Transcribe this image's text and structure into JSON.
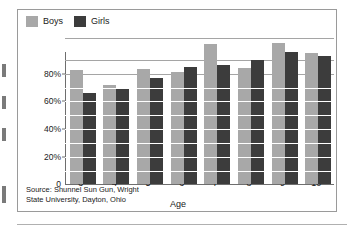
{
  "chart_data": {
    "type": "bar",
    "title": "",
    "xlabel": "Age",
    "ylabel": "",
    "categories": [
      "3",
      "4",
      "5",
      "6",
      "7",
      "8",
      "9",
      "10"
    ],
    "series": [
      {
        "name": "Boys",
        "color": "#a8a8a8",
        "values": [
          70,
          61,
          71,
          69,
          86,
          71.5,
          86.5,
          80.5
        ]
      },
      {
        "name": "Girls",
        "color": "#3c3c3c",
        "values": [
          56,
          59,
          65,
          72,
          73,
          76.5,
          81,
          79
        ]
      }
    ],
    "ylim": [
      0,
      96
    ],
    "yticks": [
      0,
      20,
      40,
      60,
      80
    ],
    "ytick_labels": [
      "0",
      "20%",
      "40%",
      "60%",
      "80%"
    ],
    "gridlines": [
      10,
      20,
      30,
      40,
      50,
      60,
      70,
      80,
      90
    ],
    "grid": true,
    "legend_position": "top-left",
    "source_note": [
      "Source: Shunnel Sun Gun, Wright",
      "State University, Dayton, Ohio"
    ]
  },
  "legend": {
    "entries": [
      {
        "label": "Boys",
        "swatch": "legend-swatch-boys"
      },
      {
        "label": "Girls",
        "swatch": "legend-swatch-girls"
      }
    ]
  },
  "axis": {
    "x_title": "Age",
    "y_labels": [
      "80%",
      "60%",
      "40%",
      "20%",
      "0"
    ],
    "x_labels": [
      "3",
      "4",
      "5",
      "6",
      "7",
      "8",
      "9",
      "10"
    ]
  },
  "source": {
    "line1": "Source: Shunnel Sun Gun, Wright",
    "line2": "State University, Dayton, Ohio"
  },
  "colors": {
    "boys": "#a8a8a8",
    "girls": "#3c3c3c",
    "grid": "#a5a5a5",
    "axis": "#6e6e6e",
    "frame": "#9a9a9a",
    "text": "#1a1a1a"
  }
}
